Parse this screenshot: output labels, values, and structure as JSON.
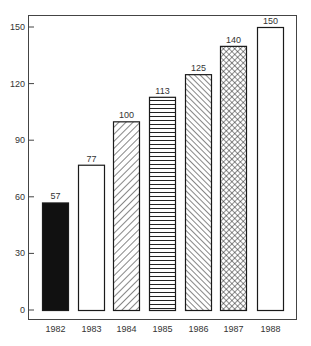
{
  "chart_data": {
    "type": "bar",
    "title": "",
    "xlabel": "",
    "ylabel": "",
    "categories": [
      "1982",
      "1983",
      "1984",
      "1985",
      "1986",
      "1987",
      "1988"
    ],
    "values": [
      57,
      77,
      100,
      113,
      125,
      140,
      150
    ],
    "value_labels": [
      "57",
      "77",
      "100",
      "113",
      "125",
      "140",
      "150"
    ],
    "fills": [
      "solid-black",
      "white",
      "diagonal-forward",
      "horizontal-lines",
      "diagonal-backward",
      "crosshatch",
      "white"
    ],
    "ylim": [
      0,
      150
    ],
    "yticks": [
      0,
      30,
      60,
      90,
      120,
      150
    ],
    "ytick_labels": [
      "0",
      "30",
      "60",
      "90",
      "120",
      "150"
    ],
    "grid": false,
    "legend": null,
    "frame": true
  },
  "colors": {
    "ink": "#1a1a1a",
    "background": "#ffffff"
  }
}
